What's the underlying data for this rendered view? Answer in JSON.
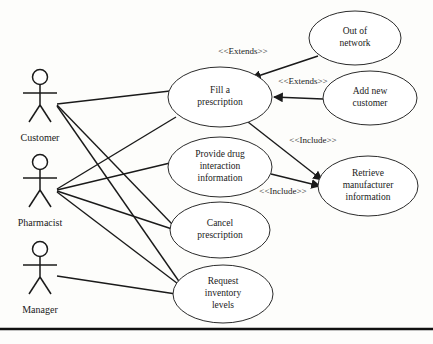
{
  "diagram": {
    "type": "uml-use-case-diagram",
    "colors": {
      "line": "#1a1a1a",
      "ellipse_fill": "#ffffff",
      "ellipse_stroke": "#2b2b2b",
      "background": "#fdfdfb",
      "rule": "#111111"
    },
    "actors": [
      {
        "id": "customer",
        "name": "Customer",
        "x": 40,
        "y": 95,
        "label_y": 139
      },
      {
        "id": "pharmacist",
        "name": "Pharmacist",
        "x": 40,
        "y": 180,
        "label_y": 224
      },
      {
        "id": "manager",
        "name": "Manager",
        "x": 40,
        "y": 267,
        "label_y": 311
      }
    ],
    "use_cases": [
      {
        "id": "fill-a-prescription",
        "lines": [
          "Fill a",
          "prescription"
        ],
        "cx": 220,
        "cy": 97,
        "rx": 52,
        "ry": 30
      },
      {
        "id": "provide-drug-interaction-information",
        "lines": [
          "Provide drug",
          "interaction",
          "information"
        ],
        "cx": 220,
        "cy": 167,
        "rx": 52,
        "ry": 30
      },
      {
        "id": "cancel-prescription",
        "lines": [
          "Cancel",
          "prescription"
        ],
        "cx": 220,
        "cy": 230,
        "rx": 50,
        "ry": 28
      },
      {
        "id": "request-inventory-levels",
        "lines": [
          "Request",
          "inventory",
          "levels"
        ],
        "cx": 223,
        "cy": 294,
        "rx": 50,
        "ry": 29
      },
      {
        "id": "out-of-network",
        "lines": [
          "Out of",
          "network"
        ],
        "cx": 355,
        "cy": 38,
        "rx": 46,
        "ry": 27
      },
      {
        "id": "add-new-customer",
        "lines": [
          "Add new",
          "customer"
        ],
        "cx": 370,
        "cy": 98,
        "rx": 47,
        "ry": 27
      },
      {
        "id": "retrieve-manufacturer-information",
        "lines": [
          "Retrieve",
          "manufacturer",
          "information"
        ],
        "cx": 368,
        "cy": 186,
        "rx": 50,
        "ry": 30
      }
    ],
    "associations": [
      {
        "id": "customer-fill-a-prescription",
        "from": "customer",
        "to": "fill-a-prescription",
        "x1": 57,
        "y1": 104,
        "x2": 170,
        "y2": 91
      },
      {
        "id": "customer-cancel-prescription",
        "from": "customer",
        "to": "cancel-prescription",
        "x1": 57,
        "y1": 105,
        "x2": 172,
        "y2": 224
      },
      {
        "id": "customer-request-inventory-levels",
        "from": "customer",
        "to": "request-inventory-levels",
        "x1": 57,
        "y1": 106,
        "x2": 185,
        "y2": 290
      },
      {
        "id": "pharmacist-fill-a-prescription",
        "from": "pharmacist",
        "to": "fill-a-prescription",
        "x1": 57,
        "y1": 189,
        "x2": 176,
        "y2": 117
      },
      {
        "id": "pharmacist-provide-drug-interaction",
        "from": "pharmacist",
        "to": "provide-drug-interaction-information",
        "x1": 57,
        "y1": 190,
        "x2": 170,
        "y2": 163
      },
      {
        "id": "pharmacist-cancel-prescription",
        "from": "pharmacist",
        "to": "cancel-prescription",
        "x1": 57,
        "y1": 191,
        "x2": 172,
        "y2": 229
      },
      {
        "id": "pharmacist-request-inventory-levels",
        "from": "pharmacist",
        "to": "request-inventory-levels",
        "x1": 57,
        "y1": 192,
        "x2": 186,
        "y2": 290
      },
      {
        "id": "manager-request-inventory-levels",
        "from": "manager",
        "to": "request-inventory-levels",
        "x1": 57,
        "y1": 276,
        "x2": 176,
        "y2": 294
      }
    ],
    "dependencies": [
      {
        "id": "out-of-network-extends-fill-a-prescription",
        "from": "out-of-network",
        "to": "fill-a-prescription",
        "stereotype": "<<Extends>>",
        "label_x": 243,
        "label_y": 52,
        "x1": 318,
        "y1": 56,
        "x2": 252,
        "y2": 78
      },
      {
        "id": "add-new-customer-extends-fill-a-prescription",
        "from": "add-new-customer",
        "to": "fill-a-prescription",
        "stereotype": "<<Extends>>",
        "label_x": 303,
        "label_y": 82,
        "x1": 323,
        "y1": 99,
        "x2": 274,
        "y2": 97
      },
      {
        "id": "fill-a-prescription-includes-retrieve-manufacturer-information",
        "from": "fill-a-prescription",
        "to": "retrieve-manufacturer-information",
        "stereotype": "<<Include>>",
        "label_x": 313,
        "label_y": 141,
        "x1": 248,
        "y1": 122,
        "x2": 322,
        "y2": 180
      },
      {
        "id": "provide-drug-interaction-includes-retrieve-manufacturer-information",
        "from": "provide-drug-interaction-information",
        "to": "retrieve-manufacturer-information",
        "stereotype": "<<Include>>",
        "label_x": 283,
        "label_y": 192,
        "x1": 271,
        "y1": 174,
        "x2": 320,
        "y2": 186
      }
    ],
    "page_rule": {
      "id": "page-rule",
      "y": 329
    }
  }
}
